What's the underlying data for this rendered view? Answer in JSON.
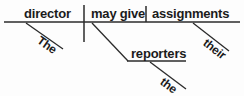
{
  "diagram": {
    "type": "reed-kellogg-sentence-diagram",
    "sentence": "The director may give reporters their assignments.",
    "ink_color": "#2b2b2b",
    "text_color": "#1b1b1b",
    "background_color": "#fdfdfd",
    "baseline": {
      "label": "main-baseline",
      "x1": 4,
      "y1": 22,
      "x2": 240,
      "y2": 22
    },
    "dividers": [
      {
        "name": "subject-predicate-divider",
        "note": "full vertical bar crossing the baseline",
        "x": 84,
        "y1": 5,
        "y2": 42
      },
      {
        "name": "verb-object-divider",
        "note": "short vertical bar standing on the baseline",
        "x": 146,
        "y1": 6,
        "y2": 22
      }
    ],
    "slots": [
      {
        "name": "subject",
        "role": "subject",
        "text": "director",
        "x": 24,
        "y": 7
      },
      {
        "name": "predicate",
        "role": "verb phrase",
        "text": "may give",
        "x": 91,
        "y": 7
      },
      {
        "name": "direct-object",
        "role": "direct object",
        "text": "assignments",
        "x": 152,
        "y": 7
      },
      {
        "name": "indirect-object",
        "role": "indirect object",
        "text": "reporters",
        "x": 131,
        "y": 47
      }
    ],
    "modifiers": [
      {
        "name": "modifier-the-subject",
        "role": "article modifying 'director'",
        "text": "The",
        "line": {
          "x1": 26,
          "y1": 23,
          "x2": 63,
          "y2": 49
        },
        "label": {
          "x": 35,
          "y": 44,
          "angle": 35
        }
      },
      {
        "name": "modifier-their-object",
        "role": "possessive adjective modifying 'assignments'",
        "text": "their",
        "line": {
          "x1": 193,
          "y1": 23,
          "x2": 229,
          "y2": 51
        },
        "label": {
          "x": 201,
          "y": 46,
          "angle": 38
        }
      },
      {
        "name": "modifier-the-indirect-object",
        "role": "article modifying 'reporters'",
        "text": "the",
        "line": {
          "x1": 150,
          "y1": 62,
          "x2": 186,
          "y2": 89
        },
        "label": {
          "x": 158,
          "y": 85,
          "angle": 37
        }
      }
    ],
    "indirect_object_branch": {
      "name": "indirect-object-branch",
      "slant": {
        "x1": 92,
        "y1": 23,
        "x2": 128,
        "y2": 61
      },
      "platform": {
        "x1": 127,
        "y1": 61,
        "x2": 186,
        "y2": 61
      }
    }
  }
}
